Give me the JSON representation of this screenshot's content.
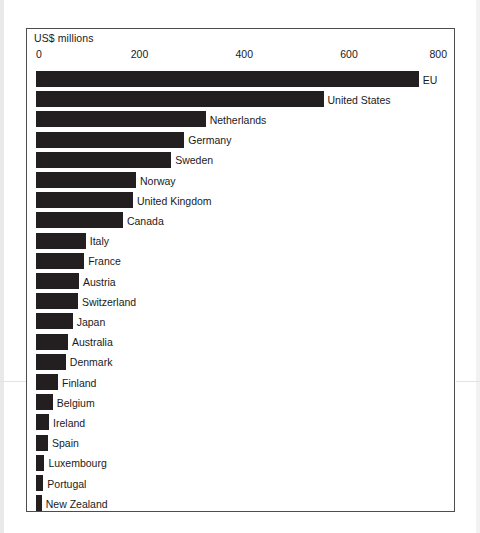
{
  "chart_data": {
    "type": "bar",
    "orientation": "horizontal",
    "title": "",
    "subtitle": "",
    "xlabel": "US$ millions",
    "ylabel": "",
    "xlim": [
      0,
      800
    ],
    "xticks": [
      0,
      200,
      400,
      600,
      800
    ],
    "xtick_labels": [
      "0",
      "200",
      "400",
      "600",
      "800"
    ],
    "grid": false,
    "legend": null,
    "bar_color": "#231f20",
    "categories": [
      "EU",
      "United States",
      "Netherlands",
      "Germany",
      "Sweden",
      "Norway",
      "United Kingdom",
      "Canada",
      "Italy",
      "France",
      "Austria",
      "Switzerland",
      "Japan",
      "Australia",
      "Denmark",
      "Finland",
      "Belgium",
      "Ireland",
      "Spain",
      "Luxembourg",
      "Portugal",
      "New Zealand"
    ],
    "values": [
      731,
      549,
      324,
      283,
      258,
      191,
      185,
      166,
      95,
      92,
      82,
      80,
      70,
      61,
      57,
      42,
      32,
      25,
      23,
      16,
      14,
      11
    ]
  },
  "axis": {
    "unit_label": "US$ millions"
  }
}
